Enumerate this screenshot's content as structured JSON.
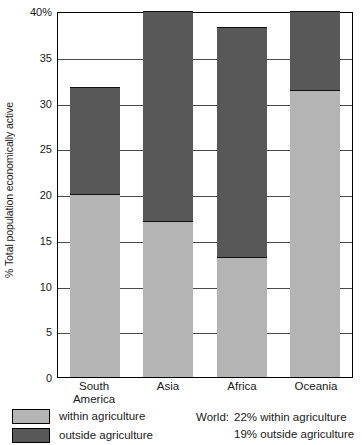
{
  "chart_data": {
    "type": "bar",
    "subtype": "stacked",
    "title": "",
    "xlabel": "",
    "ylabel": "% Total population economically active",
    "categories": [
      "South America",
      "Asia",
      "Africa",
      "Oceania"
    ],
    "category_lines": [
      [
        "South",
        "America"
      ],
      [
        "Asia",
        ""
      ],
      [
        "Africa",
        ""
      ],
      [
        "Oceania",
        ""
      ]
    ],
    "series": [
      {
        "name": "within agriculture",
        "color": "#b4b4b4",
        "values": [
          20.0,
          17.0,
          13.1,
          31.4
        ]
      },
      {
        "name": "outside agriculture",
        "color": "#585858",
        "values": [
          11.7,
          23.0,
          25.2,
          8.6
        ]
      }
    ],
    "totals": [
      31.7,
      40.0,
      38.3,
      40.0
    ],
    "ylim": [
      0,
      40
    ],
    "yticks": [
      0,
      5,
      10,
      15,
      20,
      25,
      30,
      35,
      40
    ],
    "ytick_labels": [
      "0",
      "5",
      "10",
      "15",
      "20",
      "25",
      "30",
      "35",
      "40%"
    ],
    "grid": true,
    "legend_position": "bottom-left",
    "annotations": [
      "World: 22% within agriculture",
      "19% outside agriculture"
    ]
  },
  "axis": {
    "y_title": "% Total population economically active"
  },
  "legend": {
    "items": [
      {
        "label": "within agriculture",
        "color": "#b4b4b4"
      },
      {
        "label": "outside agriculture",
        "color": "#585858"
      }
    ]
  },
  "world_note": {
    "key": "World:",
    "line1": "22% within agriculture",
    "line2": "19% outside agriculture"
  }
}
